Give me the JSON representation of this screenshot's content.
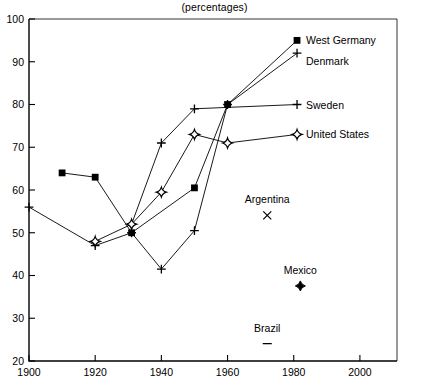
{
  "chart_data": {
    "type": "line",
    "title": "(percentages)",
    "xlabel": "",
    "ylabel": "",
    "xlim": [
      1900,
      2010
    ],
    "ylim": [
      20,
      100
    ],
    "xticks": [
      1900,
      1920,
      1940,
      1960,
      1980,
      2000
    ],
    "yticks": [
      20,
      30,
      40,
      50,
      60,
      70,
      80,
      90,
      100
    ],
    "grid": false,
    "legend": "inline-right-of-last-point",
    "series": [
      {
        "name": "West Germany",
        "marker": "filled-square",
        "label_x": 1981,
        "label_y": 95,
        "points": [
          {
            "x": 1910,
            "y": 64
          },
          {
            "x": 1920,
            "y": 63
          },
          {
            "x": 1931,
            "y": 50
          },
          {
            "x": 1950,
            "y": 60.5
          },
          {
            "x": 1960,
            "y": 80
          },
          {
            "x": 1981,
            "y": 95
          }
        ]
      },
      {
        "name": "Denmark",
        "marker": "plus",
        "label_x": 1981,
        "label_y": 92,
        "points": [
          {
            "x": 1900,
            "y": 56
          },
          {
            "x": 1920,
            "y": 47
          },
          {
            "x": 1931,
            "y": 50
          },
          {
            "x": 1940,
            "y": 41.5
          },
          {
            "x": 1950,
            "y": 50.5
          },
          {
            "x": 1960,
            "y": 80
          },
          {
            "x": 1981,
            "y": 92
          }
        ]
      },
      {
        "name": "Sweden",
        "marker": "plus",
        "label_x": 1981,
        "label_y": 80,
        "points": [
          {
            "x": 1931,
            "y": 52
          },
          {
            "x": 1940,
            "y": 71
          },
          {
            "x": 1950,
            "y": 79
          },
          {
            "x": 1981,
            "y": 80
          }
        ]
      },
      {
        "name": "United States",
        "marker": "open-diamond",
        "label_x": 1981,
        "label_y": 73,
        "points": [
          {
            "x": 1920,
            "y": 48
          },
          {
            "x": 1931,
            "y": 52
          },
          {
            "x": 1940,
            "y": 59.5
          },
          {
            "x": 1950,
            "y": 73
          },
          {
            "x": 1960,
            "y": 71
          },
          {
            "x": 1981,
            "y": 73
          }
        ]
      }
    ],
    "annotations": [
      {
        "name": "Argentina",
        "marker": "x",
        "x": 1972,
        "y": 55
      },
      {
        "name": "Mexico",
        "marker": "filled-diamond",
        "x": 1982,
        "y": 38.5
      },
      {
        "name": "Brazil",
        "marker": "dash",
        "x": 1972,
        "y": 25
      }
    ]
  },
  "axes": {
    "y_labels": [
      "100",
      "90",
      "80",
      "70",
      "60",
      "50",
      "40",
      "30",
      "20"
    ],
    "x_labels": [
      "1900",
      "1920",
      "1940",
      "1960",
      "1980",
      "2000"
    ]
  },
  "labels": {
    "title": "(percentages)",
    "west_germany": "West Germany",
    "denmark": "Denmark",
    "sweden": "Sweden",
    "united_states": "United States",
    "argentina": "Argentina",
    "mexico": "Mexico",
    "brazil": "Brazil"
  },
  "colors": {
    "ink": "#000000",
    "background": "#ffffff"
  }
}
